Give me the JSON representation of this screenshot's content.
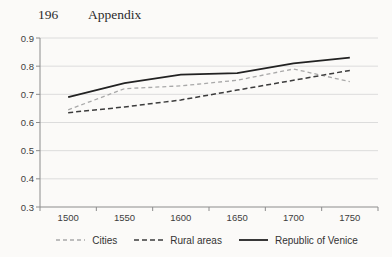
{
  "page": {
    "number": "196",
    "title": "Appendix"
  },
  "chart_data": {
    "type": "line",
    "title": "",
    "xlabel": "",
    "ylabel": "",
    "categories": [
      1500,
      1550,
      1600,
      1650,
      1700,
      1750
    ],
    "x_tick_labels": [
      "1500",
      "1550",
      "1600",
      "1650",
      "1700",
      "1750"
    ],
    "y_ticks": [
      0.3,
      0.4,
      0.5,
      0.6,
      0.7,
      0.8,
      0.9
    ],
    "ylim": [
      0.3,
      0.9
    ],
    "grid": "horizontal",
    "legend_position": "bottom",
    "series": [
      {
        "name": "Cities",
        "style": "dashed",
        "color": "#a9a9a9",
        "dash": "4 3",
        "width": 1.3,
        "values": [
          0.645,
          0.72,
          0.73,
          0.75,
          0.79,
          0.745
        ]
      },
      {
        "name": "Rural areas",
        "style": "dashed",
        "color": "#3c3c3c",
        "dash": "5 3",
        "width": 1.5,
        "values": [
          0.635,
          0.655,
          0.68,
          0.715,
          0.75,
          0.785
        ]
      },
      {
        "name": "Republic of Venice",
        "style": "solid",
        "color": "#222222",
        "dash": "",
        "width": 1.8,
        "values": [
          0.69,
          0.74,
          0.77,
          0.775,
          0.81,
          0.83
        ]
      }
    ],
    "colors": {
      "gridline": "#dcdcdc",
      "axis": "#8c8c8c",
      "tick_text": "#3d3d3d",
      "background": "#fbfaf8"
    }
  }
}
